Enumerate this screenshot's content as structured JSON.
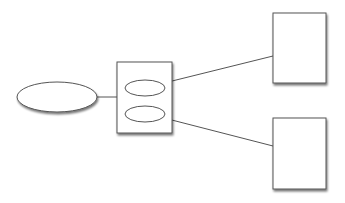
{
  "diagram": {
    "background": "#ffffff",
    "stroke_color": "#555555",
    "fill_color": "#ffffff",
    "shadow_color": "#8a8a8a",
    "nodes": [
      {
        "id": "source-ellipse",
        "shape": "ellipse",
        "cx": 57,
        "cy": 97,
        "rx": 40,
        "ry": 15,
        "label": ""
      },
      {
        "id": "container-box",
        "shape": "rect",
        "x": 117,
        "y": 62,
        "w": 55,
        "h": 71,
        "label": ""
      },
      {
        "id": "inner-ellipse-top",
        "shape": "ellipse",
        "cx": 145,
        "cy": 88,
        "rx": 20,
        "ry": 8,
        "label": ""
      },
      {
        "id": "inner-ellipse-bottom",
        "shape": "ellipse",
        "cx": 145,
        "cy": 114,
        "rx": 20,
        "ry": 8,
        "label": ""
      },
      {
        "id": "target-box-top",
        "shape": "rect",
        "x": 273,
        "y": 13,
        "w": 53,
        "h": 70,
        "label": ""
      },
      {
        "id": "target-box-bottom",
        "shape": "rect",
        "x": 273,
        "y": 118,
        "w": 53,
        "h": 71,
        "label": ""
      }
    ],
    "edges": [
      {
        "from": "source-ellipse",
        "to": "container-box",
        "x1": 97,
        "y1": 97,
        "x2": 117,
        "y2": 97
      },
      {
        "from": "inner-ellipse-top",
        "to": "target-box-top",
        "x1": 164,
        "y1": 83,
        "x2": 273,
        "y2": 56
      },
      {
        "from": "inner-ellipse-bottom",
        "to": "target-box-bottom",
        "x1": 164,
        "y1": 118,
        "x2": 273,
        "y2": 146
      }
    ]
  }
}
